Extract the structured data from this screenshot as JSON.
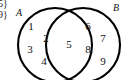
{
  "figure": {
    "type": "venn-diagram",
    "width": 126,
    "height": 80,
    "background_color": "#ffffff",
    "stroke_color": "#000000",
    "text_color": "#111111"
  },
  "cutoff_text": {
    "line1": "5}",
    "line2": "9}"
  },
  "sets": [
    {
      "id": "A",
      "label": "A",
      "label_x": 19,
      "label_y": 13,
      "circle": {
        "cx": 55,
        "cy": 45,
        "r": 37
      }
    },
    {
      "id": "B",
      "label": "B",
      "label_x": 116,
      "label_y": 8,
      "circle": {
        "cx": 83,
        "cy": 45,
        "r": 37
      }
    }
  ],
  "elements": [
    {
      "value": "1",
      "region": "A-only",
      "x": 31,
      "y": 26
    },
    {
      "value": "2",
      "region": "A-only",
      "x": 46,
      "y": 38
    },
    {
      "value": "3",
      "region": "A-only",
      "x": 30,
      "y": 49
    },
    {
      "value": "4",
      "region": "A-only",
      "x": 44,
      "y": 61
    },
    {
      "value": "5",
      "region": "intersection",
      "x": 69,
      "y": 44
    },
    {
      "value": "6",
      "region": "B-only",
      "x": 88,
      "y": 26
    },
    {
      "value": "7",
      "region": "B-only",
      "x": 103,
      "y": 38
    },
    {
      "value": "8",
      "region": "B-only",
      "x": 88,
      "y": 49
    },
    {
      "value": "9",
      "region": "B-only",
      "x": 103,
      "y": 61
    }
  ]
}
